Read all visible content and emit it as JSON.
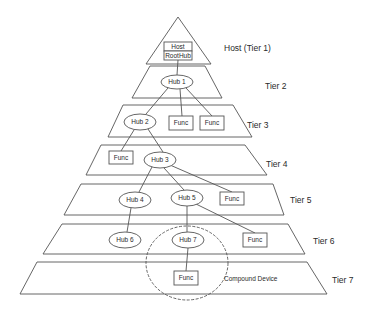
{
  "diagram": {
    "colors": {
      "stroke": "#555555",
      "text": "#2a2a2a",
      "background": "#ffffff"
    },
    "host": {
      "triangle": [
        [
          178,
          17
        ],
        [
          146,
          64
        ],
        [
          211,
          64
        ]
      ],
      "label": "Host (Tier 1)",
      "label_pos": [
        224,
        51
      ],
      "boxes": [
        {
          "id": "host",
          "label": "Host",
          "x": 164,
          "y": 42,
          "w": 28,
          "h": 9
        },
        {
          "id": "roothub",
          "label": "RootHub",
          "x": 164,
          "y": 51,
          "w": 28,
          "h": 9
        }
      ]
    },
    "tiers": [
      {
        "id": "tier2",
        "label": "Tier 2",
        "top": [
          150,
          205,
          66
        ],
        "bottom": [
          132,
          222,
          98
        ],
        "label_pos": [
          265,
          89
        ]
      },
      {
        "id": "tier3",
        "label": "Tier 3",
        "top": [
          123,
          233,
          105
        ],
        "bottom": [
          108,
          252,
          137
        ],
        "label_pos": [
          247,
          128
        ]
      },
      {
        "id": "tier4",
        "label": "Tier 4",
        "top": [
          101,
          245,
          145
        ],
        "bottom": [
          86,
          267,
          175
        ],
        "label_pos": [
          266,
          167
        ]
      },
      {
        "id": "tier5",
        "label": "Tier 5",
        "top": [
          81,
          273,
          184
        ],
        "bottom": [
          64,
          284,
          215
        ],
        "label_pos": [
          290,
          203
        ]
      },
      {
        "id": "tier6",
        "label": "Tier 6",
        "top": [
          62,
          288,
          224
        ],
        "bottom": [
          43,
          305,
          254
        ],
        "label_pos": [
          313,
          244
        ]
      },
      {
        "id": "tier7",
        "label": "Tier 7",
        "top": [
          37,
          307,
          262
        ],
        "bottom": [
          20,
          327,
          294
        ],
        "label_pos": [
          332,
          283
        ]
      }
    ],
    "hubs": [
      {
        "id": "hub1",
        "label": "Hub 1",
        "cx": 177,
        "cy": 82,
        "rx": 16,
        "ry": 7
      },
      {
        "id": "hub2",
        "label": "Hub 2",
        "cx": 140,
        "cy": 122,
        "rx": 16,
        "ry": 8
      },
      {
        "id": "hub3",
        "label": "Hub 3",
        "cx": 160,
        "cy": 160,
        "rx": 16,
        "ry": 8
      },
      {
        "id": "hub4",
        "label": "Hub 4",
        "cx": 135,
        "cy": 200,
        "rx": 16,
        "ry": 8
      },
      {
        "id": "hub5",
        "label": "Hub 5",
        "cx": 187,
        "cy": 198,
        "rx": 16,
        "ry": 8
      },
      {
        "id": "hub6",
        "label": "Hub 6",
        "cx": 125,
        "cy": 240,
        "rx": 16,
        "ry": 8
      },
      {
        "id": "hub7",
        "label": "Hub 7",
        "cx": 188,
        "cy": 240,
        "rx": 16,
        "ry": 8
      }
    ],
    "funcs": [
      {
        "id": "func-t3a",
        "label": "Func",
        "x": 169,
        "y": 116,
        "w": 24,
        "h": 14
      },
      {
        "id": "func-t3b",
        "label": "Func",
        "x": 200,
        "y": 116,
        "w": 24,
        "h": 14
      },
      {
        "id": "func-t4",
        "label": "Func",
        "x": 109,
        "y": 151,
        "w": 24,
        "h": 13
      },
      {
        "id": "func-t5",
        "label": "Func",
        "x": 220,
        "y": 192,
        "w": 24,
        "h": 13
      },
      {
        "id": "func-t6",
        "label": "Func",
        "x": 243,
        "y": 233,
        "w": 24,
        "h": 14
      },
      {
        "id": "func-t7",
        "label": "Func",
        "x": 174,
        "y": 271,
        "w": 24,
        "h": 14
      }
    ],
    "links": [
      [
        178,
        60,
        177,
        75
      ],
      [
        168,
        88,
        146,
        114
      ],
      [
        180,
        89,
        182,
        116
      ],
      [
        186,
        88,
        212,
        116
      ],
      [
        134,
        130,
        121,
        151
      ],
      [
        148,
        129,
        163,
        152
      ],
      [
        152,
        167,
        139,
        192
      ],
      [
        164,
        168,
        184,
        190
      ],
      [
        170,
        165,
        232,
        192
      ],
      [
        131,
        208,
        127,
        232
      ],
      [
        187,
        206,
        187,
        232
      ],
      [
        196,
        204,
        255,
        233
      ],
      [
        188,
        248,
        186,
        271
      ]
    ],
    "compound_device": {
      "label": "Compound Device",
      "cx": 187,
      "cy": 263,
      "rx": 41,
      "ry": 37,
      "label_pos": [
        224,
        281
      ]
    }
  }
}
